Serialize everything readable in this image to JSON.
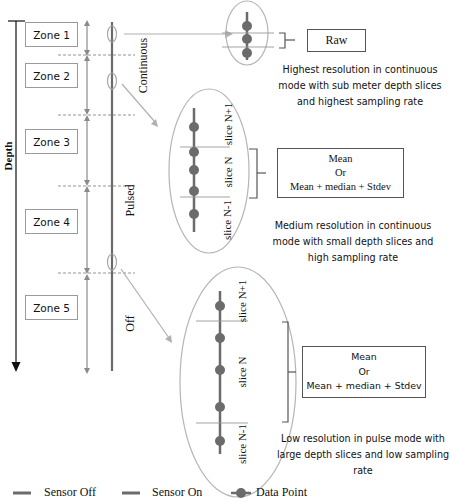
{
  "axis": {
    "depth_label": "Depth"
  },
  "zones": [
    {
      "label": "Zone 1"
    },
    {
      "label": "Zone 2"
    },
    {
      "label": "Zone 3"
    },
    {
      "label": "Zone 4"
    },
    {
      "label": "Zone 5"
    }
  ],
  "modes": {
    "continuous": "Continuous",
    "pulsed": "Pulsed",
    "off": "Off"
  },
  "detail_high": {
    "result": "Raw",
    "caption_lines": [
      "Highest resolution in continuous",
      "mode with sub meter depth slices",
      "and highest sampling rate"
    ]
  },
  "detail_medium": {
    "slices": [
      "slice N+1",
      "slice N",
      "slice N-1"
    ],
    "result_lines": [
      "Mean",
      "Or",
      "Mean + median + Stdev"
    ],
    "caption_lines": [
      "Medium resolution in continuous",
      "mode with small depth slices and",
      "high sampling rate"
    ]
  },
  "detail_low": {
    "slices": [
      "slice N+1",
      "slice N",
      "slice N-1"
    ],
    "result_lines": [
      "Mean",
      "Or",
      "Mean + median + Stdev"
    ],
    "caption_lines": [
      "Low resolution in pulse mode with",
      "large depth slices and low sampling",
      "rate"
    ]
  },
  "legend": {
    "sensor_off": "Sensor Off",
    "sensor_on": "Sensor On",
    "data_point": "Data Point"
  },
  "colors": {
    "sensor_line": "#6b6b6b",
    "data_point": "#6b6b6b",
    "ellipse": "#b5b5b5",
    "arrow": "#b0b0b0",
    "dashed": "#888888"
  }
}
